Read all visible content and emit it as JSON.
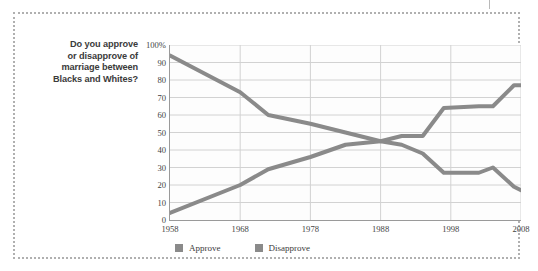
{
  "question": {
    "line1": "Do you approve",
    "line2": "or disapprove of",
    "line3": "marriage between",
    "line4": "Blacks and Whites?"
  },
  "legend": [
    {
      "label": "Approve",
      "color": "#8a8a8a"
    },
    {
      "label": "Disapprove",
      "color": "#8a8a8a"
    }
  ],
  "colors": {
    "approve_line": "#8a8a8a",
    "disapprove_line": "#8a8a8a",
    "grid": "#d2d2d2",
    "axis": "#9a9a9a",
    "frame": "#b0b0b0",
    "text": "#3b3b3b"
  },
  "chart_data": {
    "type": "line",
    "title": "",
    "xlabel": "",
    "ylabel": "",
    "xlim": [
      1958,
      2008
    ],
    "ylim": [
      0,
      100
    ],
    "grid": true,
    "legend_position": "bottom",
    "xticks": [
      1958,
      1968,
      1978,
      1988,
      1998,
      2008
    ],
    "xtick_labels": [
      "1958",
      "1968",
      "1978",
      "1988",
      "1998",
      "2008"
    ],
    "yticks": [
      0,
      10,
      20,
      30,
      40,
      50,
      60,
      70,
      80,
      90,
      100
    ],
    "ytick_labels": [
      "0",
      "10",
      "20",
      "30",
      "40",
      "50",
      "60",
      "70",
      "80",
      "90",
      "100%"
    ],
    "series": [
      {
        "name": "Approve",
        "x": [
          1958,
          1968,
          1972,
          1978,
          1983,
          1988,
          1991,
          1994,
          1997,
          2002,
          2004,
          2007,
          2008
        ],
        "values": [
          4,
          20,
          29,
          36,
          43,
          45,
          48,
          48,
          64,
          65,
          65,
          77,
          77
        ]
      },
      {
        "name": "Disapprove",
        "x": [
          1958,
          1968,
          1972,
          1978,
          1983,
          1988,
          1991,
          1994,
          1997,
          2002,
          2004,
          2007,
          2008
        ],
        "values": [
          94,
          73,
          60,
          55,
          50,
          45,
          43,
          38,
          27,
          27,
          30,
          19,
          17
        ]
      }
    ]
  }
}
